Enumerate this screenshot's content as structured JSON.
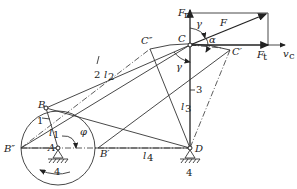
{
  "diagram": {
    "type": "four-bar linkage pressure angle diagram",
    "points": {
      "A": "A",
      "B": "B",
      "B_prime": "B′",
      "B_double": "B″",
      "C": "C",
      "C_prime": "C′",
      "C_double": "C″",
      "D": "D"
    },
    "links": {
      "l1": "l",
      "l1_sub": "1",
      "l2": "l",
      "l2_sub": "2",
      "l3": "l",
      "l3_sub": "3",
      "l4": "l",
      "l4_sub": "4"
    },
    "link_numbers": {
      "n1": "1",
      "n2": "2",
      "n3": "3",
      "ground_A": "4",
      "ground_D": "4"
    },
    "angles": {
      "phi": "φ",
      "gamma_top": "γ",
      "gamma_bottom": "γ",
      "alpha": "α"
    },
    "forces": {
      "F": "F",
      "Fn": "F",
      "Fn_sub": "n",
      "Ft": "F",
      "Ft_sub": "t",
      "vc": "v",
      "vc_sub": "c"
    },
    "colors": {
      "line": "#333333",
      "background": "#ffffff"
    }
  }
}
